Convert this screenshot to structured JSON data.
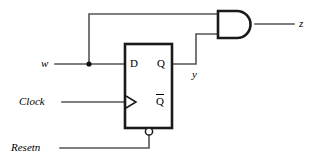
{
  "diagram": {
    "background_color": "#ffffff",
    "wire_color": "#555555",
    "outline_color": "#1a1a1a",
    "labels": {
      "input_w": "w",
      "input_clock": "Clock",
      "input_resetn": "Resetn",
      "output_z": "z",
      "internal_y": "y",
      "pin_d": "D",
      "pin_q": "Q",
      "pin_qbar": "Q",
      "pin_qbar_overbar": true
    },
    "components": [
      {
        "name": "d-flip-flop",
        "type": "flip-flop",
        "pins": [
          "D",
          "Q",
          "Q-bar",
          "clock",
          "resetn"
        ],
        "box": {
          "x": 125,
          "y": 44,
          "w": 47,
          "h": 84
        }
      },
      {
        "name": "and-gate",
        "type": "and",
        "inputs": 2,
        "output": "z",
        "box": {
          "x": 218,
          "y": 11,
          "w": 37,
          "h": 27
        }
      }
    ],
    "nets": [
      {
        "name": "w-to-d",
        "from": "input_w",
        "to": "D"
      },
      {
        "name": "w-to-and-top",
        "from": "input_w",
        "to": "and-input-0"
      },
      {
        "name": "q-to-and-bottom",
        "from": "Q",
        "to": "and-input-1",
        "label": "y"
      },
      {
        "name": "clock-to-ff",
        "from": "input_clock",
        "to": "clock-pin"
      },
      {
        "name": "resetn-to-ff",
        "from": "input_resetn",
        "to": "resetn-pin"
      },
      {
        "name": "and-to-z",
        "from": "and-output",
        "to": "output_z"
      }
    ],
    "junctions": [
      {
        "name": "w-branch-dot",
        "x": 89,
        "y": 64
      }
    ]
  }
}
